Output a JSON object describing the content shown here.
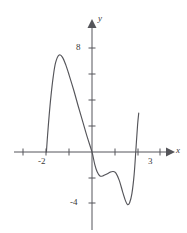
{
  "figure": {
    "kind": "cartesian-graph",
    "background_color": "#ffffff",
    "curve_color": "#55555a",
    "axis_color": "#55555a",
    "text_color": "#3a3a3a",
    "width": 187,
    "height": 233
  },
  "axes": {
    "x_label": "x",
    "y_label": "y",
    "origin_px": {
      "x": 92,
      "y": 152
    },
    "unit_px": {
      "x": 22.8,
      "y": 13.0
    },
    "x_range": [
      -2.95,
      3.75
    ],
    "y_range": [
      -6.2,
      9.2
    ],
    "grid": false,
    "legend": false
  },
  "x_ticks": [
    {
      "value": -3,
      "label": "",
      "px": 23
    },
    {
      "value": -2,
      "label": "-2",
      "px": 46
    },
    {
      "value": -1,
      "label": "",
      "px": 69
    },
    {
      "value": 1,
      "label": "",
      "px": 115
    },
    {
      "value": 2,
      "label": "",
      "px": 138
    },
    {
      "value": 3,
      "label": "3",
      "px": 160
    }
  ],
  "y_ticks": [
    {
      "value": 8,
      "label": "8",
      "px": 48
    },
    {
      "value": 6,
      "label": "",
      "px": 74
    },
    {
      "value": 4,
      "label": "",
      "px": 100
    },
    {
      "value": 2,
      "label": "",
      "px": 126
    },
    {
      "value": -2,
      "label": "",
      "px": 178
    },
    {
      "value": -4,
      "label": "-4",
      "px": 203
    }
  ],
  "chart_data": {
    "type": "line",
    "title": "",
    "subtitle": "",
    "xlabel": "x",
    "ylabel": "y",
    "xlim": [
      -2.95,
      3.75
    ],
    "ylim": [
      -6.2,
      9.2
    ],
    "grid": false,
    "legend_position": "none",
    "annotations": [],
    "series": [
      {
        "name": "f(x)",
        "color": "#55555a",
        "endpoints_open": true,
        "x_domain": [
          -2.0,
          2.05
        ],
        "key_points": [
          {
            "x": -2.0,
            "y": 0.0,
            "role": "left-endpoint-on-x-axis"
          },
          {
            "x": -1.45,
            "y": 7.45,
            "role": "local-maximum"
          },
          {
            "x": 0.0,
            "y": 0.0,
            "role": "x-intercept-and-y-intercept"
          },
          {
            "x": 0.35,
            "y": -1.85,
            "role": "local-minimum"
          },
          {
            "x": 0.92,
            "y": -1.5,
            "role": "local-maximum"
          },
          {
            "x": 1.56,
            "y": -4.05,
            "role": "local-minimum"
          },
          {
            "x": 2.05,
            "y": 3.0,
            "role": "right-endpoint"
          }
        ],
        "points": [
          {
            "x": -2.0,
            "y": 0.0
          },
          {
            "x": -1.95,
            "y": 1.25
          },
          {
            "x": -1.88,
            "y": 2.8
          },
          {
            "x": -1.8,
            "y": 4.3
          },
          {
            "x": -1.7,
            "y": 5.8
          },
          {
            "x": -1.6,
            "y": 6.85
          },
          {
            "x": -1.45,
            "y": 7.45
          },
          {
            "x": -1.3,
            "y": 7.3
          },
          {
            "x": -1.15,
            "y": 6.7
          },
          {
            "x": -1.0,
            "y": 5.9
          },
          {
            "x": -0.8,
            "y": 4.75
          },
          {
            "x": -0.6,
            "y": 3.5
          },
          {
            "x": -0.4,
            "y": 2.3
          },
          {
            "x": -0.2,
            "y": 1.1
          },
          {
            "x": 0.0,
            "y": 0.0
          },
          {
            "x": 0.12,
            "y": -0.95
          },
          {
            "x": 0.22,
            "y": -1.5
          },
          {
            "x": 0.35,
            "y": -1.85
          },
          {
            "x": 0.5,
            "y": -1.82
          },
          {
            "x": 0.65,
            "y": -1.7
          },
          {
            "x": 0.8,
            "y": -1.55
          },
          {
            "x": 0.92,
            "y": -1.5
          },
          {
            "x": 1.05,
            "y": -1.62
          },
          {
            "x": 1.2,
            "y": -2.2
          },
          {
            "x": 1.35,
            "y": -3.1
          },
          {
            "x": 1.48,
            "y": -3.8
          },
          {
            "x": 1.56,
            "y": -4.05
          },
          {
            "x": 1.65,
            "y": -3.9
          },
          {
            "x": 1.75,
            "y": -3.2
          },
          {
            "x": 1.85,
            "y": -1.7
          },
          {
            "x": 1.93,
            "y": 0.3
          },
          {
            "x": 2.0,
            "y": 2.1
          },
          {
            "x": 2.05,
            "y": 3.0
          }
        ]
      }
    ]
  }
}
